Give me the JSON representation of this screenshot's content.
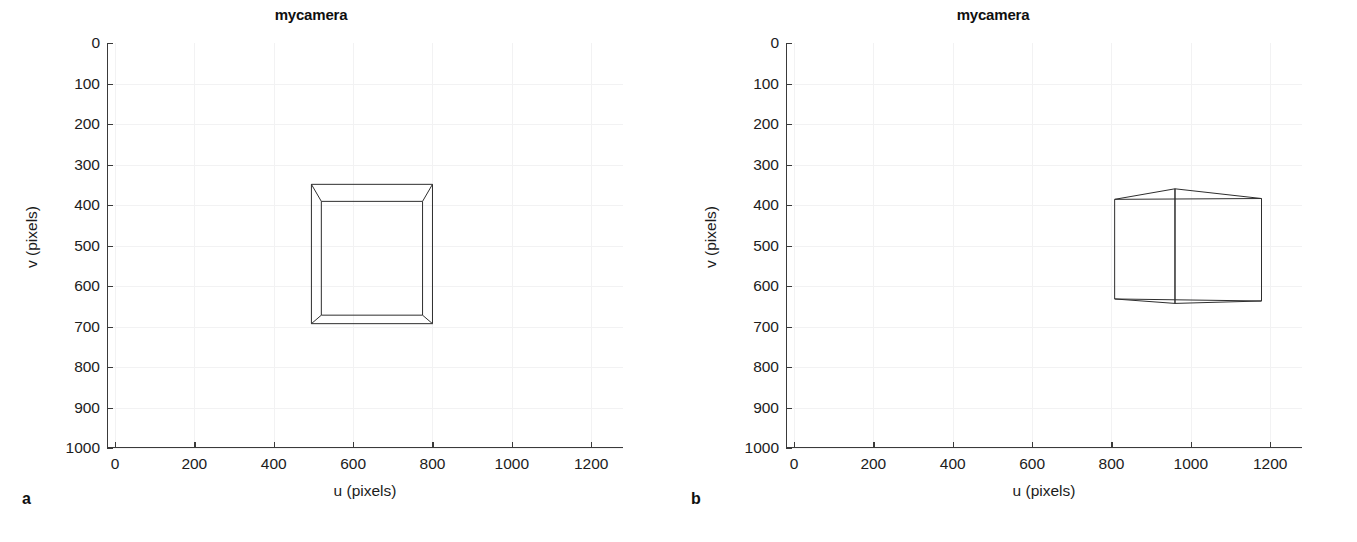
{
  "figure": {
    "panels": [
      {
        "letter": "a",
        "title": "mycamera",
        "xlabel": "u (pixels)",
        "ylabel": "v (pixels)"
      },
      {
        "letter": "b",
        "title": "mycamera",
        "xlabel": "u (pixels)",
        "ylabel": "v (pixels)"
      }
    ]
  },
  "chart_data": [
    {
      "type": "line",
      "title": "mycamera",
      "panel": "a",
      "xlabel": "u (pixels)",
      "ylabel": "v (pixels)",
      "xlim": [
        -20,
        1280
      ],
      "ylim": [
        1000,
        0
      ],
      "y_inverted": true,
      "xticks": [
        0,
        200,
        400,
        600,
        800,
        1000,
        1200
      ],
      "xticklabels": [
        "0",
        "200",
        "400",
        "600",
        "800",
        "1000",
        "1200"
      ],
      "yticks": [
        0,
        100,
        200,
        300,
        400,
        500,
        600,
        700,
        800,
        900,
        1000
      ],
      "yticklabels": [
        "0",
        "100",
        "200",
        "300",
        "400",
        "500",
        "600",
        "700",
        "800",
        "900",
        "1000"
      ],
      "grid": true,
      "legend": null,
      "description": "Projected wireframe cube viewed head-on: outer (near) square face and smaller inner (far) square face connected by four diagonal edges",
      "series": [
        {
          "name": "cube-near-face",
          "closed": true,
          "points": [
            [
              495,
              349
            ],
            [
              800,
              349
            ],
            [
              800,
              693
            ],
            [
              495,
              693
            ]
          ]
        },
        {
          "name": "cube-far-face",
          "closed": true,
          "points": [
            [
              520,
              391
            ],
            [
              775,
              391
            ],
            [
              775,
              672
            ],
            [
              520,
              672
            ]
          ]
        },
        {
          "name": "cube-connector-top-left",
          "closed": false,
          "points": [
            [
              495,
              349
            ],
            [
              520,
              391
            ]
          ]
        },
        {
          "name": "cube-connector-top-right",
          "closed": false,
          "points": [
            [
              800,
              349
            ],
            [
              775,
              391
            ]
          ]
        },
        {
          "name": "cube-connector-bottom-right",
          "closed": false,
          "points": [
            [
              800,
              693
            ],
            [
              775,
              672
            ]
          ]
        },
        {
          "name": "cube-connector-bottom-left",
          "closed": false,
          "points": [
            [
              495,
              693
            ],
            [
              520,
              672
            ]
          ]
        }
      ]
    },
    {
      "type": "line",
      "title": "mycamera",
      "panel": "b",
      "xlabel": "u (pixels)",
      "ylabel": "v (pixels)",
      "xlim": [
        -20,
        1280
      ],
      "ylim": [
        1000,
        0
      ],
      "y_inverted": true,
      "xticks": [
        0,
        200,
        400,
        600,
        800,
        1000,
        1200
      ],
      "xticklabels": [
        "0",
        "200",
        "400",
        "600",
        "800",
        "1000",
        "1200"
      ],
      "yticks": [
        0,
        100,
        200,
        300,
        400,
        500,
        600,
        700,
        800,
        900,
        1000
      ],
      "yticklabels": [
        "0",
        "100",
        "200",
        "300",
        "400",
        "500",
        "600",
        "700",
        "800",
        "900",
        "1000"
      ],
      "grid": true,
      "legend": null,
      "description": "Projected wireframe cube viewed from an oblique angle showing two visible side faces and a near vertical corner edge",
      "series": [
        {
          "name": "cube-left-face",
          "closed": true,
          "points": [
            [
              808,
              386
            ],
            [
              960,
              360
            ],
            [
              960,
              643
            ],
            [
              808,
              632
            ]
          ]
        },
        {
          "name": "cube-right-face",
          "closed": true,
          "points": [
            [
              960,
              360
            ],
            [
              1178,
              384
            ],
            [
              1178,
              637
            ],
            [
              960,
              643
            ]
          ]
        },
        {
          "name": "cube-top-back-edge",
          "closed": false,
          "points": [
            [
              808,
              386
            ],
            [
              1178,
              384
            ]
          ]
        },
        {
          "name": "cube-bottom-back-edge",
          "closed": false,
          "points": [
            [
              808,
              632
            ],
            [
              1178,
              637
            ]
          ]
        }
      ]
    }
  ]
}
